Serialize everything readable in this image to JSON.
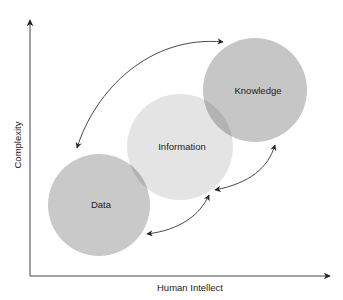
{
  "diagram": {
    "type": "concept-relationship",
    "x_axis_label": "Human Intellect",
    "y_axis_label": "Complexity",
    "nodes": [
      {
        "id": "data",
        "label": "Data",
        "color": "#c9c9c9"
      },
      {
        "id": "information",
        "label": "Information",
        "color": "#e4e4e4"
      },
      {
        "id": "knowledge",
        "label": "Knowledge",
        "color": "#c6c6c6"
      }
    ],
    "overlap_color": "#b3b3b3",
    "edges": [
      {
        "from": "knowledge",
        "to": "data",
        "type": "bidirectional"
      },
      {
        "from": "data",
        "to": "information",
        "type": "bidirectional"
      },
      {
        "from": "information",
        "to": "knowledge",
        "type": "bidirectional"
      }
    ],
    "line_color": "#333333"
  }
}
